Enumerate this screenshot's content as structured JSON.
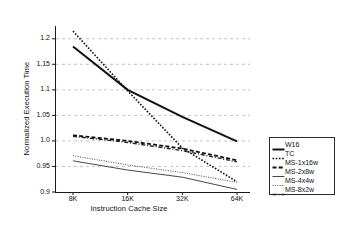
{
  "chart_data": {
    "type": "line",
    "title": "",
    "xlabel": "Instruction Cache Size",
    "ylabel": "Normalized Execution Time",
    "categories": [
      "8K",
      "16K",
      "32K",
      "64K"
    ],
    "ylim": [
      0.9,
      1.225
    ],
    "yticks": [
      "0.9",
      "0.95",
      "1.0",
      "1.05",
      "1.1",
      "1.15",
      "1.2"
    ],
    "ytick_values": [
      0.9,
      0.95,
      1.0,
      1.05,
      1.1,
      1.15,
      1.2
    ],
    "grid": "horizontal-dashed",
    "legend_position": "right-outside",
    "series": [
      {
        "name": "W16",
        "values": [
          1.185,
          1.1,
          1.047,
          0.999
        ],
        "style": "solid",
        "width": 2.0,
        "color": "#111111"
      },
      {
        "name": "TC",
        "values": [
          1.215,
          1.098,
          0.986,
          0.92
        ],
        "style": "dotted",
        "width": 1.6,
        "color": "#111111"
      },
      {
        "name": "MS-1x16w",
        "values": [
          1.011,
          1.0,
          0.985,
          0.962
        ],
        "style": "dashed",
        "width": 1.8,
        "color": "#111111"
      },
      {
        "name": "MS-2x8w",
        "values": [
          0.961,
          0.943,
          0.929,
          0.905
        ],
        "style": "solid",
        "width": 0.9,
        "color": "#333333"
      },
      {
        "name": "MS-4x4w",
        "values": [
          0.971,
          0.953,
          0.938,
          0.919
        ],
        "style": "dotted",
        "width": 0.9,
        "color": "#333333"
      },
      {
        "name": "MS-8x2w",
        "values": [
          1.009,
          0.997,
          0.981,
          0.959
        ],
        "style": "dashdot",
        "width": 1.4,
        "color": "#222222"
      }
    ]
  },
  "legend": {
    "entries": [
      {
        "label": "W16"
      },
      {
        "label": "TC"
      },
      {
        "label": "MS-1x16w"
      },
      {
        "label": "MS-2x8w"
      },
      {
        "label": "MS-4x4w"
      },
      {
        "label": "MS-8x2w"
      }
    ]
  }
}
